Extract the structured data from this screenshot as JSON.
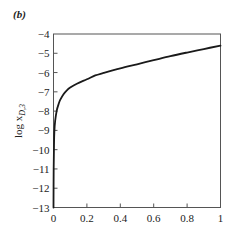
{
  "panel_label": "(b)",
  "chart_data": {
    "type": "line",
    "title": "",
    "panel_label": "(b)",
    "xlabel": "",
    "ylabel": "log x_{D,3}",
    "ylabel_parts": {
      "main": "log x",
      "subscript": "D,3"
    },
    "xlim": [
      0,
      1
    ],
    "ylim": [
      -13,
      -4
    ],
    "x_ticks": [
      0,
      0.2,
      0.4,
      0.6,
      0.8,
      1
    ],
    "x_tick_labels": [
      "0",
      "0.2",
      "0.4",
      "0.6",
      "0.8",
      "1"
    ],
    "y_ticks": [
      -4,
      -5,
      -6,
      -7,
      -8,
      -9,
      -10,
      -11,
      -12,
      -13
    ],
    "y_tick_labels": [
      "−4",
      "−5",
      "−6",
      "−7",
      "−8",
      "−9",
      "−10",
      "−11",
      "−12",
      "−13"
    ],
    "grid": false,
    "legend": null,
    "series": [
      {
        "name": "log x_{D,3}",
        "color": "#1a1a1a",
        "x": [
          0.0,
          0.001,
          0.003,
          0.005,
          0.01,
          0.02,
          0.03,
          0.04,
          0.06,
          0.08,
          0.1,
          0.14,
          0.2,
          0.25,
          0.3,
          0.4,
          0.5,
          0.6,
          0.7,
          0.8,
          0.9,
          1.0
        ],
        "y": [
          -13.0,
          -11.0,
          -9.8,
          -9.1,
          -8.5,
          -7.95,
          -7.65,
          -7.42,
          -7.12,
          -6.92,
          -6.78,
          -6.58,
          -6.35,
          -6.15,
          -6.02,
          -5.78,
          -5.57,
          -5.36,
          -5.15,
          -4.96,
          -4.78,
          -4.6
        ]
      }
    ]
  }
}
